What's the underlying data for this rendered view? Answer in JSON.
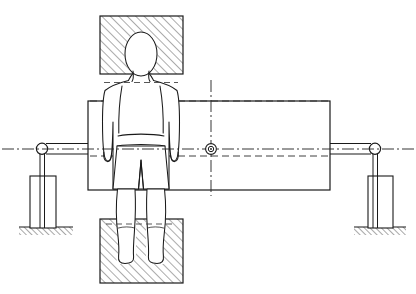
{
  "figure": {
    "domain": "technical-line-drawing",
    "canvas": {
      "width": 416,
      "height": 294,
      "background": "#ffffff"
    },
    "line_color": "#1a1a1a",
    "hatch_color": "#555555",
    "figure_fill": "#ffffff"
  },
  "parts": {
    "main_beam": {
      "label": "main horizontal beam",
      "x": 88,
      "y": 101,
      "width": 242,
      "height": 89,
      "stroke": "#1a1a1a",
      "stroke_width": 1.1
    },
    "top_block": {
      "label": "upper hatched fixture block",
      "x": 100,
      "y": 16,
      "width": 83,
      "height": 58,
      "hatch": "diagonal-45",
      "stroke": "#1a1a1a"
    },
    "bottom_block": {
      "label": "lower hatched fixture block",
      "x": 100,
      "y": 219,
      "width": 83,
      "height": 64,
      "hatch": "diagonal-45",
      "stroke": "#1a1a1a"
    },
    "center_mark": {
      "label": "center pivot mark",
      "cx": 211,
      "cy": 149,
      "r_outer": 5.2,
      "r_inner": 2.6,
      "r_dot": 1.0
    },
    "vertical_centerline": {
      "label": "vertical dash-dot centerline",
      "x": 211,
      "y1": 80,
      "y2": 196,
      "style": "dash-dot"
    },
    "horizontal_centerline": {
      "label": "horizontal dash-dot centerline",
      "y": 149,
      "x1": 2,
      "x2": 414,
      "style": "dash-dot"
    },
    "beam_top_dash": {
      "label": "upper dashed construction line",
      "y": 101,
      "x1": 90,
      "x2": 330,
      "style": "dashed"
    },
    "beam_waist_dash": {
      "label": "lower dashed construction line",
      "y": 156,
      "x1": 90,
      "x2": 330,
      "style": "dashed"
    }
  },
  "left_support": {
    "label": "left roller support assembly",
    "roller": {
      "cx": 42,
      "cy": 149,
      "r": 5.5
    },
    "arm": {
      "x1": 42,
      "y1": 144,
      "x2": 90,
      "y2": 144
    },
    "arm_lower": {
      "x1": 42,
      "y1": 154,
      "x2": 90,
      "y2": 154
    },
    "rod": {
      "x1": 42,
      "y1": 154,
      "x2": 42,
      "y2": 228
    },
    "pedestal": {
      "x": 30,
      "y": 176,
      "width": 26,
      "height": 52
    },
    "ground": {
      "x": 19,
      "y": 227,
      "width": 54,
      "height": 8,
      "hatch": "diagonal-45"
    }
  },
  "right_support": {
    "label": "right roller support assembly",
    "roller": {
      "cx": 375,
      "cy": 149,
      "r": 5.5
    },
    "arm": {
      "x1": 328,
      "y1": 144,
      "x2": 375,
      "y2": 144
    },
    "arm_lower": {
      "x1": 328,
      "y1": 154,
      "x2": 375,
      "y2": 154
    },
    "rod": {
      "x1": 375,
      "y1": 154,
      "x2": 375,
      "y2": 228
    },
    "pedestal": {
      "x": 368,
      "y": 176,
      "width": 25,
      "height": 52
    },
    "ground": {
      "x": 354,
      "y": 227,
      "width": 52,
      "height": 8,
      "hatch": "diagonal-45"
    }
  },
  "human_figure": {
    "label": "standing human figure, front view",
    "center_x": 141,
    "head": {
      "cx": 141,
      "cy": 54,
      "rx": 16,
      "ry": 22
    },
    "neck_y": 76,
    "shoulder_y": 82,
    "shoulder_half_width": 38,
    "waist_y": 133,
    "hip_y": 146,
    "shorts_hem_y": 190,
    "knee_y": 218,
    "ankle_y": 252,
    "foot_y": 262,
    "arm_outer_offset": 38,
    "stroke": "#1a1a1a",
    "stroke_width": 1.0,
    "fill": "#ffffff"
  },
  "detail_lines": {
    "chest_line_y": 105,
    "waistband_y": 146,
    "shoulder_dash_y": 84,
    "hip_dash_y": 143,
    "knee_dash_y": 226
  }
}
